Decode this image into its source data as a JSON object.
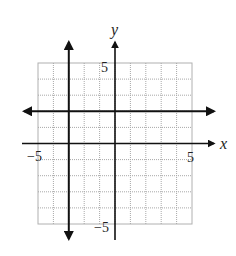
{
  "diagram": {
    "type": "coordinate-plane",
    "x_axis_label": "x",
    "y_axis_label": "y",
    "x_range": [
      -5,
      5
    ],
    "y_range": [
      -5,
      5
    ],
    "grid_step": 1,
    "tick_labels": {
      "x_min": "−5",
      "x_max": "5",
      "y_max": "5",
      "y_min": "−5"
    },
    "lines": [
      {
        "name": "horizontal-line",
        "equation": "y = 2",
        "arrows": "both"
      },
      {
        "name": "vertical-line",
        "equation": "x = -3",
        "arrows": "both"
      }
    ],
    "colors": {
      "grid": "#a8a8a8",
      "axes": "#111111",
      "lines": "#111111",
      "background": "#ffffff"
    }
  }
}
